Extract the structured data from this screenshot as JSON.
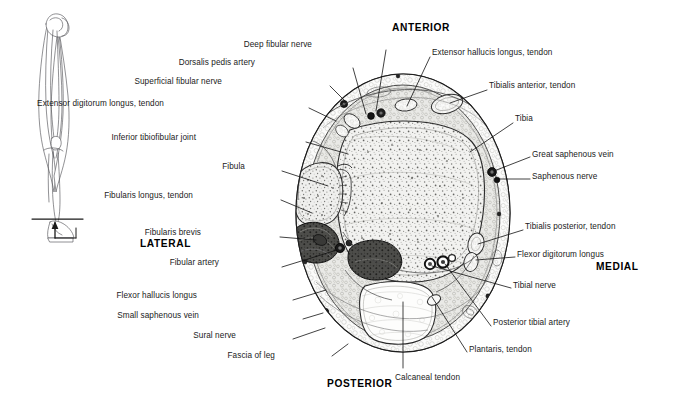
{
  "figure": {
    "type": "anatomical-cross-section",
    "region": "Transverse section through the ankle / distal leg",
    "orientation_labels": [
      {
        "id": "anterior",
        "text": "ANTERIOR",
        "x": 392,
        "y": 22
      },
      {
        "id": "posterior",
        "text": "POSTERIOR",
        "x": 327,
        "y": 378
      },
      {
        "id": "lateral",
        "text": "LATERAL",
        "x": 140,
        "y": 238
      },
      {
        "id": "medial",
        "text": "MEDIAL",
        "x": 596,
        "y": 261
      }
    ],
    "labels_left": [
      {
        "id": "deep-fibular-nerve",
        "text": "Deep fibular nerve",
        "x": 312,
        "y": 40,
        "align": "right",
        "lx": 386,
        "ly": 50,
        "tx": 376,
        "ty": 113
      },
      {
        "id": "dorsalis-pedis-artery",
        "text": "Dorsalis pedis artery",
        "x": 255,
        "y": 58,
        "align": "right",
        "lx": 353,
        "ly": 68,
        "tx": 366,
        "ty": 116
      },
      {
        "id": "superficial-fibular-nerve",
        "text": "Superficial fibular nerve",
        "x": 222,
        "y": 77,
        "align": "right",
        "lx": 330,
        "ly": 86,
        "tx": 346,
        "ty": 103
      },
      {
        "id": "extensor-digitorum-longus-tendon",
        "text": "Extensor digitorum longus, tendon",
        "x": 164,
        "y": 99,
        "align": "right",
        "lx": 309,
        "ly": 108,
        "tx": 336,
        "ty": 121
      },
      {
        "id": "inferior-tibiofibular-joint",
        "text": "Inferior tibiofibular joint",
        "x": 196,
        "y": 133,
        "align": "right",
        "lx": 306,
        "ly": 142,
        "tx": 348,
        "ty": 154
      },
      {
        "id": "fibula",
        "text": "Fibula",
        "x": 245,
        "y": 162,
        "align": "right",
        "lx": 282,
        "ly": 171,
        "tx": 330,
        "ty": 186
      },
      {
        "id": "fibularis-longus-tendon",
        "text": "Fibularis longus,\ntendon",
        "x": 193,
        "y": 196,
        "align": "right",
        "lx": 281,
        "ly": 202,
        "tx": 312,
        "ty": 213
      },
      {
        "id": "fibularis-brevis",
        "text": "Fibularis brevis",
        "x": 201,
        "y": 228,
        "align": "right",
        "lx": 280,
        "ly": 237,
        "tx": 318,
        "ty": 240
      },
      {
        "id": "fibular-artery",
        "text": "Fibular artery",
        "x": 219,
        "y": 258,
        "align": "right",
        "lx": 282,
        "ly": 267,
        "tx": 337,
        "ty": 249
      },
      {
        "id": "flexor-hallucis-longus",
        "text": "Flexor hallucis longus",
        "x": 197,
        "y": 291,
        "align": "right",
        "lx": 293,
        "ly": 300,
        "tx": 327,
        "ty": 290
      },
      {
        "id": "small-saphenous-vein",
        "text": "Small saphenous vein",
        "x": 199,
        "y": 312,
        "align": "right",
        "lx": 303,
        "ly": 320,
        "tx": 325,
        "ty": 312
      },
      {
        "id": "sural-nerve",
        "text": "Sural nerve",
        "x": 236,
        "y": 332,
        "align": "right",
        "lx": 293,
        "ly": 340,
        "tx": 326,
        "ty": 327
      },
      {
        "id": "fascia-of-leg",
        "text": "Fascia of leg",
        "x": 275,
        "y": 352,
        "align": "right",
        "lx": 332,
        "ly": 357,
        "tx": 348,
        "ty": 345
      }
    ],
    "labels_right": [
      {
        "id": "extensor-hallucis-longus-tendon",
        "text": "Extensor hallucis longus, tendon",
        "x": 432,
        "y": 48,
        "align": "left",
        "lx": 430,
        "ly": 57,
        "tx": 406,
        "ty": 108
      },
      {
        "id": "tibialis-anterior-tendon",
        "text": "Tibialis anterior, tendon",
        "x": 489,
        "y": 81,
        "align": "left",
        "lx": 487,
        "ly": 90,
        "tx": 447,
        "ty": 105
      },
      {
        "id": "tibia",
        "text": "Tibia",
        "x": 515,
        "y": 114,
        "align": "left",
        "lx": 513,
        "ly": 123,
        "tx": 470,
        "ty": 153
      },
      {
        "id": "great-saphenous-vein",
        "text": "Great saphenous vein",
        "x": 532,
        "y": 150,
        "align": "left",
        "lx": 530,
        "ly": 158,
        "tx": 492,
        "ty": 172
      },
      {
        "id": "saphenous-nerve",
        "text": "Saphenous nerve",
        "x": 532,
        "y": 172,
        "align": "left",
        "lx": 530,
        "ly": 180,
        "tx": 497,
        "ty": 177
      },
      {
        "id": "tibialis-posterior-tendon",
        "text": "Tibialis posterior, tendon",
        "x": 525,
        "y": 222,
        "align": "left",
        "lx": 523,
        "ly": 231,
        "tx": 475,
        "ty": 245
      },
      {
        "id": "flexor-digitorum-longus",
        "text": "Flexor digitorum longus",
        "x": 517,
        "y": 250,
        "align": "left",
        "lx": 515,
        "ly": 258,
        "tx": 470,
        "ty": 258
      },
      {
        "id": "tibial-nerve",
        "text": "Tibial nerve",
        "x": 513,
        "y": 281,
        "align": "left",
        "lx": 511,
        "ly": 289,
        "tx": 430,
        "ty": 264
      },
      {
        "id": "posterior-tibial-artery",
        "text": "Posterior tibial artery",
        "x": 493,
        "y": 318,
        "align": "left",
        "lx": 491,
        "ly": 327,
        "tx": 443,
        "ty": 262
      },
      {
        "id": "plantaris-tendon",
        "text": "Plantaris, tendon",
        "x": 469,
        "y": 345,
        "align": "left",
        "lx": 467,
        "ly": 353,
        "tx": 430,
        "ty": 290
      },
      {
        "id": "calcaneal-tendon",
        "text": "Calcaneal tendon",
        "x": 395,
        "y": 373,
        "align": "left",
        "lx": 403,
        "ly": 370,
        "tx": 403,
        "ty": 300
      }
    ],
    "orientation_diagram": {
      "id": "leg-orientation-diagram",
      "description": "Lateral line drawing of lower limb with transverse section plane at the ankle"
    }
  }
}
